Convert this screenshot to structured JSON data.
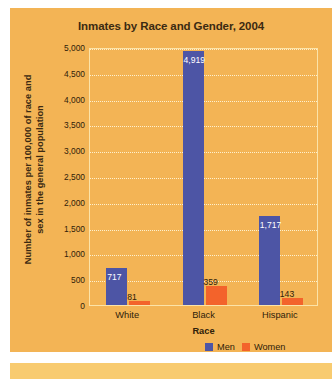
{
  "chart_data": {
    "type": "bar",
    "title": "Inmates by Race and Gender, 2004",
    "xlabel": "Race",
    "ylabel": "Number of inmates per 100,000 of race and sex in the general population",
    "categories": [
      "White",
      "Black",
      "Hispanic"
    ],
    "series": [
      {
        "name": "Men",
        "color": "#4d55a5",
        "values": [
          717,
          4919,
          1717
        ],
        "labels": [
          "717",
          "4,919",
          "1,717"
        ]
      },
      {
        "name": "Women",
        "color": "#f3632b",
        "values": [
          81,
          359,
          143
        ],
        "labels": [
          "81",
          "359",
          "143"
        ]
      }
    ],
    "ylim": [
      0,
      5000
    ],
    "ytick_values": [
      0,
      500,
      1000,
      1500,
      2000,
      2500,
      3000,
      3500,
      4000,
      4500,
      5000
    ],
    "ytick_labels": [
      "0",
      "500",
      "1,000",
      "1,500",
      "2,000",
      "2,500",
      "3,000",
      "3,500",
      "4,000",
      "4,500",
      "5,000"
    ],
    "grid": true,
    "legend_position": "bottom-right"
  },
  "colors": {
    "panel_background": "#f3b455",
    "bottom_band": "#f8cb70",
    "page_background": "#ffffff",
    "plot_border": "#fbe3a8",
    "gridline": "#fdf0cd",
    "men": "#4d55a5",
    "women": "#f3632b",
    "text": "#2f2109",
    "title_text": "#3b2a12"
  }
}
